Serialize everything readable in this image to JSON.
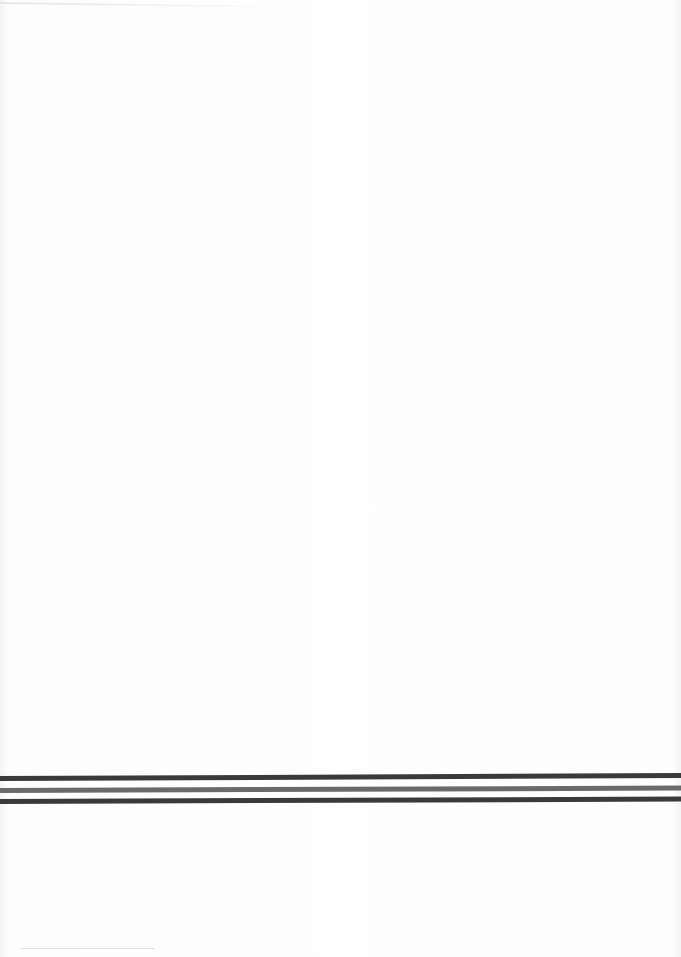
{
  "document": {
    "type": "blank scanned page",
    "text": "",
    "rules": [
      {
        "name": "rule-1",
        "color": "#3a3a3a"
      },
      {
        "name": "rule-2",
        "color": "#6a6a6a"
      },
      {
        "name": "rule-3",
        "color": "#3a3a3a"
      }
    ]
  }
}
